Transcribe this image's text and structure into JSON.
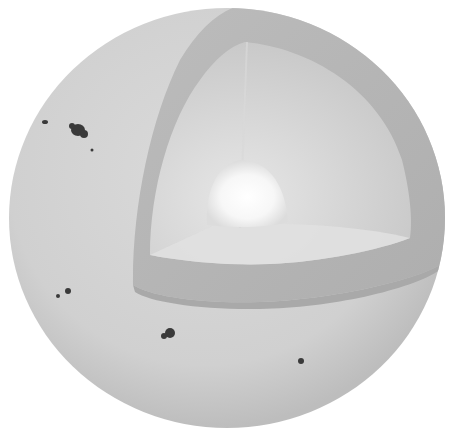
{
  "illustration": {
    "subject": "Sun cutaway diagram (grayscale)",
    "layers": [
      "photosphere",
      "convective zone",
      "radiative zone",
      "core"
    ],
    "sunspot_groups": 6,
    "colors": {
      "background": "#ffffff",
      "surface": "#d3d3d3",
      "surface_edge": "#bdbdbd",
      "convective_shell": "#b8b8b8",
      "radiative_zone": "#cfcfcf",
      "core": "#ffffff",
      "sunspot": "#3a3a3a"
    }
  }
}
